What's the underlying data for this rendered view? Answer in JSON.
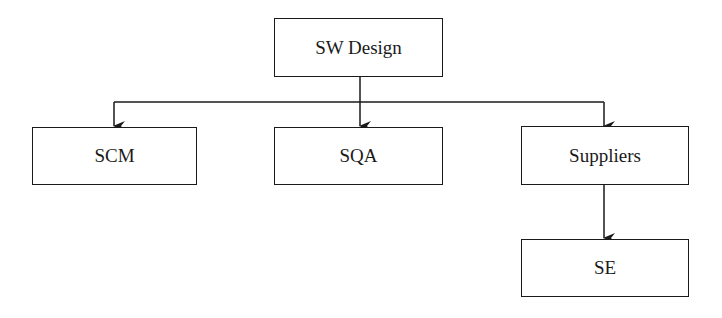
{
  "diagram": {
    "type": "hierarchy",
    "root": {
      "label": "SW Design"
    },
    "children": [
      {
        "label": "SCM"
      },
      {
        "label": "SQA"
      },
      {
        "label": "Suppliers",
        "children": [
          {
            "label": "SE"
          }
        ]
      }
    ],
    "colors": {
      "stroke": "#1a1a1a",
      "background": "#ffffff"
    }
  }
}
